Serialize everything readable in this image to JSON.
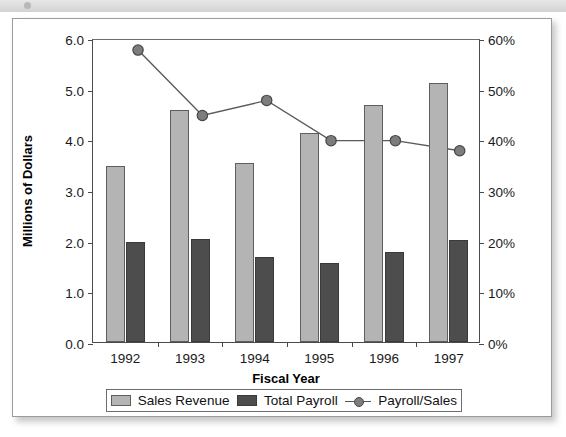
{
  "chart_data": {
    "type": "bar",
    "title": "",
    "subtitle": "",
    "xlabel": "Fiscal Year",
    "ylabel": "Millions of Dollars",
    "y2label": "",
    "categories": [
      "1992",
      "1993",
      "1994",
      "1995",
      "1996",
      "1997"
    ],
    "ylim": [
      0.0,
      6.0
    ],
    "yticks": [
      "0.0",
      "1.0",
      "2.0",
      "3.0",
      "4.0",
      "5.0",
      "6.0"
    ],
    "ytick_values": [
      0.0,
      1.0,
      2.0,
      3.0,
      4.0,
      5.0,
      6.0
    ],
    "y2lim": [
      0,
      60
    ],
    "y2ticks": [
      "0%",
      "10%",
      "20%",
      "30%",
      "40%",
      "50%",
      "60%"
    ],
    "y2tick_values": [
      0,
      10,
      20,
      30,
      40,
      50,
      60
    ],
    "grid": false,
    "legend_position": "bottom",
    "series": [
      {
        "name": "Sales Revenue",
        "type": "bar",
        "axis": "left",
        "color": "#b4b4b4",
        "values": [
          3.47,
          4.57,
          3.53,
          4.12,
          4.67,
          5.12
        ]
      },
      {
        "name": "Total Payroll",
        "type": "bar",
        "axis": "left",
        "color": "#4d4d4d",
        "values": [
          1.98,
          2.03,
          1.68,
          1.56,
          1.77,
          2.02
        ]
      },
      {
        "name": "Payroll/Sales",
        "type": "line",
        "axis": "right",
        "color": "#7d7d7d",
        "values": [
          58,
          45,
          48,
          40,
          40,
          38
        ]
      }
    ]
  },
  "legend": {
    "items": [
      {
        "label": "Sales Revenue"
      },
      {
        "label": "Total Payroll"
      },
      {
        "label": "Payroll/Sales"
      }
    ]
  }
}
